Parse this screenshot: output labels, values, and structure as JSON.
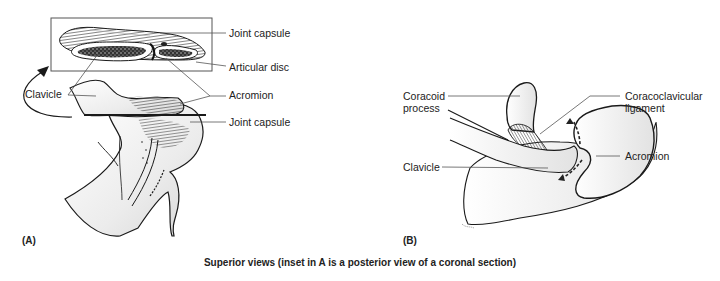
{
  "figure": {
    "caption": "Superior views (inset in A is a posterior view of a coronal section)",
    "panels": [
      {
        "id": "A",
        "label": "(A)",
        "labels": {
          "joint_capsule_top": "Joint capsule",
          "articular_disc": "Articular disc",
          "acromion": "Acromion",
          "joint_capsule_bottom": "Joint capsule",
          "clavicle": "Clavicle"
        }
      },
      {
        "id": "B",
        "label": "(B)",
        "labels": {
          "coracoid_line1": "Coracoid",
          "coracoid_line2": "process",
          "coracoclavicular_line1": "Coracoclavicular",
          "coracoclavicular_line2": "ligament",
          "clavicle": "Clavicle",
          "acromion": "Acromion"
        }
      }
    ]
  },
  "colors": {
    "ink": "#1a1a1a",
    "leader": "#555555",
    "bone_fill": "#f1f1f1",
    "shade": "#bdbdbd"
  }
}
